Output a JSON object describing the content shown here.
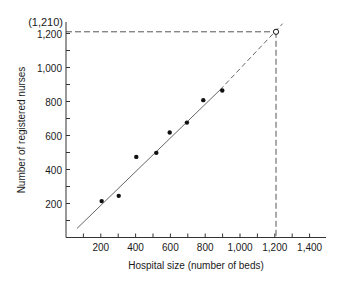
{
  "chart_data": {
    "type": "scatter",
    "title": "",
    "xlabel": "Hospital size (number of beds)",
    "ylabel": "Number of registered nurses",
    "xlim": [
      0,
      1500
    ],
    "ylim": [
      0,
      1300
    ],
    "x_ticks": [
      200,
      400,
      600,
      800,
      1000,
      1200,
      1400
    ],
    "x_tick_labels": [
      "200",
      "400",
      "600",
      "800",
      "1,000",
      "1,200",
      "1,400"
    ],
    "x_minor_step": 100,
    "y_ticks": [
      200,
      400,
      600,
      800,
      1000,
      1200
    ],
    "y_tick_labels": [
      "200",
      "400",
      "600",
      "800",
      "1,000",
      "1,200"
    ],
    "y_minor_step": 100,
    "grid": false,
    "legend": null,
    "series": [
      {
        "name": "Hospitals",
        "kind": "scatter",
        "x": [
          205,
          303,
          404,
          519,
          596,
          695,
          789,
          898
        ],
        "y": [
          214,
          245,
          474,
          498,
          618,
          676,
          808,
          865
        ]
      }
    ],
    "regression_line": {
      "solid_from": [
        63,
        53
      ],
      "solid_to": [
        885,
        868
      ],
      "dashed_to": [
        1245,
        1258
      ]
    },
    "prediction": {
      "x": 1207,
      "y": 1210,
      "label": "(1,210)",
      "marker": "open-circle",
      "guide_lines": "dashed"
    }
  },
  "colors": {
    "axis": "#333333",
    "line": "#666666",
    "points": "#111111",
    "dashed": "#555555"
  }
}
